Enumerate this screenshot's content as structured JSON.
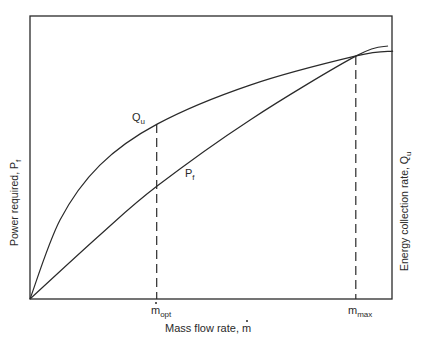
{
  "chart_data": {
    "type": "line",
    "title": "",
    "xlabel": "Mass flow rate, ṁ",
    "ylabel_left": "Power required, Pf",
    "ylabel_right": "Energy collection rate, Qu",
    "xlim": [
      0,
      1
    ],
    "ylim": [
      0,
      1
    ],
    "grid": false,
    "legend": "inline curve labels",
    "x_ticks": [
      {
        "label": "ṁopt",
        "base": "ṁ",
        "sub": "opt",
        "x": 0.35
      },
      {
        "label": "mmax",
        "base": "m",
        "sub": "max",
        "x": 0.9
      }
    ],
    "series": [
      {
        "name": "Qu",
        "label_base": "Q",
        "label_sub": "u",
        "description": "Energy collection rate (concave, saturating)",
        "x": [
          0.0,
          0.083,
          0.193,
          0.351,
          0.608,
          0.901,
          1.003
        ],
        "y": [
          0.0,
          0.279,
          0.473,
          0.618,
          0.756,
          0.859,
          0.876
        ]
      },
      {
        "name": "Pf",
        "label_base": "P",
        "label_sub": "f",
        "description": "Power required (slightly convex, rising)",
        "x": [
          0.0,
          0.193,
          0.351,
          0.608,
          0.901,
          0.989
        ],
        "y": [
          0.0,
          0.226,
          0.399,
          0.633,
          0.859,
          0.894
        ]
      }
    ],
    "annotations": [
      {
        "type": "dashed-vline",
        "at": "ṁopt",
        "x": 0.35,
        "from_y": 0.0,
        "to_y": 0.618
      },
      {
        "type": "dashed-vline",
        "at": "mmax",
        "x": 0.9,
        "from_y": 0.0,
        "to_y": 0.859
      },
      {
        "type": "intersection",
        "x": 0.9,
        "y": 0.859,
        "note": "Qu = Pf at mmax"
      }
    ]
  },
  "labels": {
    "qu_base": "Q",
    "qu_sub": "u",
    "pf_base": "P",
    "pf_sub": "f",
    "mopt_base": "m",
    "mopt_sub": "opt",
    "mmax_base": "m",
    "mmax_sub": "max",
    "xlabel_text": "Mass flow rate, ",
    "xlabel_symbol": "m",
    "ylabel_left_text": "Power required, P",
    "ylabel_left_sub": "f",
    "ylabel_right_text": "Energy collection rate, Q",
    "ylabel_right_sub": "u"
  },
  "colors": {
    "ink": "#2a2a2a",
    "background": "#ffffff"
  }
}
